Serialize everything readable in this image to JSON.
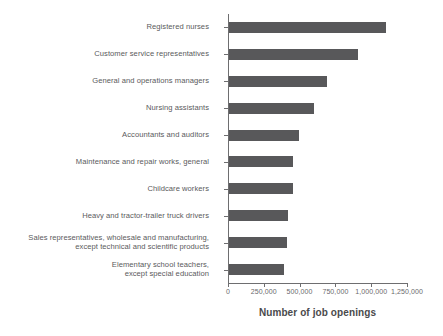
{
  "chart_data": {
    "type": "bar",
    "orientation": "horizontal",
    "title": "",
    "subtitle": "",
    "xlabel": "Number of job openings",
    "ylabel": "",
    "xlim": [
      0,
      1250000
    ],
    "ylim": null,
    "grid": false,
    "legend": null,
    "legend_position": "none",
    "bar_color": "#58585a",
    "axis_color": "#6e6e70",
    "text_color": "#5a5a5c",
    "background_color": "#ffffff",
    "xticks": [
      0,
      250000,
      500000,
      750000,
      1000000,
      1250000
    ],
    "xticklabels": [
      "0",
      "250,000",
      "500,000",
      "750,000",
      "1,000,000",
      "1,250,000"
    ],
    "categories": [
      "Registered nurses",
      "Customer service representatives",
      "General and operations managers",
      "Nursing assistants",
      "Accountants and auditors",
      "Maintenance and repair works, general",
      "Childcare workers",
      "Heavy and tractor-trailer truck drivers",
      "Sales representatives, wholesale and manufacturing,\nexcept technical and scientific products",
      "Elementary school teachers,\nexcept special education"
    ],
    "values": [
      1095000,
      900000,
      685000,
      595000,
      490000,
      450000,
      445000,
      410000,
      408000,
      385000
    ]
  },
  "axis": {
    "title": "Number of job openings"
  }
}
